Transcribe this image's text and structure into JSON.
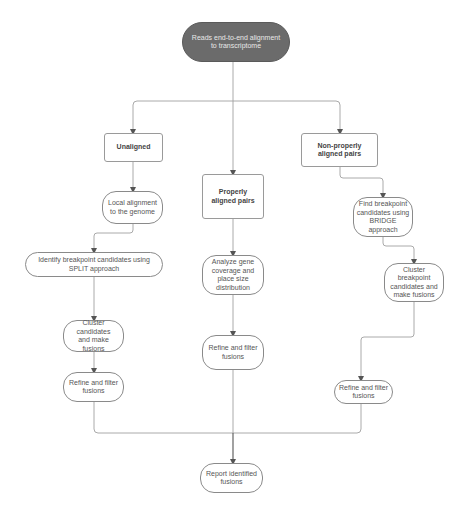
{
  "diagram": {
    "type": "flowchart",
    "nodes": {
      "start": "Reads end-to-end alignment to transcriptome",
      "unaligned": "Unaligned",
      "properly": "Properly aligned pairs",
      "nonproperly": "Non-properly aligned pairs",
      "local_alignment": "Local alignment to the genome",
      "split": "Identify breakpoint candidates using SPLIT approach",
      "cluster_left": "Cluster candidates and make fusions",
      "refine_left": "Refine and filter fusions",
      "analyze": "Analyze gene coverage and place size distribution",
      "refine_middle": "Refine and filter fusions",
      "bridge": "Find breakpoint candidates using BRIDGE approach",
      "cluster_right": "Cluster breakpoint candidates and make fusions",
      "refine_right": "Refine and filter fusions",
      "report": "Report identified fusions"
    },
    "edges": [
      [
        "start",
        "unaligned"
      ],
      [
        "start",
        "properly"
      ],
      [
        "start",
        "nonproperly"
      ],
      [
        "unaligned",
        "local_alignment"
      ],
      [
        "local_alignment",
        "split"
      ],
      [
        "split",
        "cluster_left"
      ],
      [
        "cluster_left",
        "refine_left"
      ],
      [
        "properly",
        "analyze"
      ],
      [
        "analyze",
        "refine_middle"
      ],
      [
        "nonproperly",
        "bridge"
      ],
      [
        "bridge",
        "cluster_right"
      ],
      [
        "cluster_right",
        "refine_right"
      ],
      [
        "refine_left",
        "report"
      ],
      [
        "refine_middle",
        "report"
      ],
      [
        "refine_right",
        "report"
      ]
    ],
    "colors": {
      "start_fill": "#6b6b6b",
      "node_border": "#8a8a8a",
      "edge": "#9a9a9a",
      "text": "#555555"
    }
  }
}
